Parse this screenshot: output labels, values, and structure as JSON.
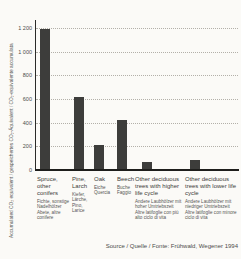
{
  "chart_data": {
    "type": "bar",
    "title": "",
    "ylabel": "Accumulated CO₂ equivalent / gespeichertes CO₂-Äquivalent / CO₂-equivalente accumulata",
    "xlabel": "",
    "ylim": [
      0,
      1200
    ],
    "grid": "dotted horizontal",
    "legend": "none",
    "yticks": [
      {
        "value": 0,
        "label": "0"
      },
      {
        "value": 200,
        "label": "200"
      },
      {
        "value": 400,
        "label": "400"
      },
      {
        "value": 600,
        "label": "600"
      },
      {
        "value": 800,
        "label": "800"
      },
      {
        "value": 1000,
        "label": "1 000"
      },
      {
        "value": 1200,
        "label": "1 200"
      }
    ],
    "categories": [
      {
        "en": "Spruce, other conifers",
        "de": "Fichte, sonstige Nadelhölzer",
        "it": "Abete, altre conifere"
      },
      {
        "en": "Pine, Larch",
        "de": "Kiefer, Lärche,",
        "it": "Pino, Larice"
      },
      {
        "en": "Oak",
        "de": "Eiche",
        "it": "Quercia"
      },
      {
        "en": "Beech",
        "de": "Buche",
        "it": "Faggio"
      },
      {
        "en": "Other deciduous trees with higher life cycle",
        "de": "Andere Laubhölzer mit hoher Umtriebszeit",
        "it": "Altre latifoglie con più alto ciclo di vita"
      },
      {
        "en": "Other deciduous trees with lower life cycle",
        "de": "Andere Laubhölzer mit niedriger Umtriebszeit",
        "it": "Altre latifoglie con minore ciclo di vita"
      }
    ],
    "values": [
      1190,
      620,
      210,
      420,
      70,
      85
    ],
    "source": "Source / Quelle / Fonte: Frühwald, Wegener 1994",
    "colors": {
      "bar": "#3d3d3b",
      "axis": "#1e1e1c",
      "grid": "#b3b0a9",
      "background": "#fbfaf7"
    },
    "layout": {
      "bar_width_px": 10,
      "bar_centers_px": [
        45,
        79,
        99,
        122,
        147,
        195
      ],
      "label_lefts_px": [
        37,
        72,
        94,
        117,
        135,
        185
      ],
      "label_widths_px": [
        34,
        22,
        22,
        24,
        50,
        54
      ]
    }
  }
}
